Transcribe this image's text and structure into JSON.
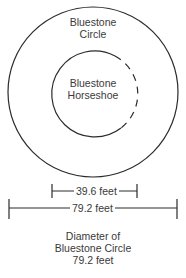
{
  "diagram": {
    "outer_circle": {
      "label_line1": "Bluestone",
      "label_line2": "Circle"
    },
    "inner_circle": {
      "label_line1": "Bluestone",
      "label_line2": "Horseshoe",
      "open_side": "right (dashed)"
    },
    "dimensions": [
      {
        "label": "39.6 feet",
        "spans": "inner horseshoe"
      },
      {
        "label": "79.2 feet",
        "spans": "outer circle"
      }
    ],
    "caption": {
      "line1": "Diameter of",
      "line2": "Bluestone Circle",
      "line3": "79.2 feet"
    },
    "colors": {
      "stroke": "#2b2b2b",
      "text": "#3a3a3a",
      "background": "#ffffff"
    }
  }
}
